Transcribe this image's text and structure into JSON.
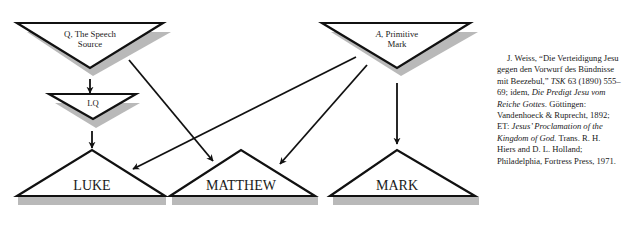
{
  "colors": {
    "stroke": "#111111",
    "shadow": "#b9b9b9",
    "text": "#1a1a1a",
    "background": "#ffffff"
  },
  "sources": {
    "q": {
      "line1": "Q, The Speech",
      "line2": "Source"
    },
    "lq": {
      "label": "LQ"
    },
    "a": {
      "siglum": "A",
      "line1_rest": ", Primitive",
      "line2": "Mark"
    }
  },
  "gospels": {
    "luke": {
      "label": "LUKE"
    },
    "matthew": {
      "label": "MATTHEW"
    },
    "mark": {
      "label": "MARK"
    }
  },
  "arrows": [
    {
      "from": "Q",
      "to": "LQ"
    },
    {
      "from": "LQ",
      "to": "LUKE"
    },
    {
      "from": "Q",
      "to": "MATTHEW"
    },
    {
      "from": "A",
      "to": "LUKE"
    },
    {
      "from": "A",
      "to": "MATTHEW"
    },
    {
      "from": "A",
      "to": "MARK"
    }
  ],
  "note": {
    "p1": "J. Weiss, “Die Verteidigung Jesu gegen den Vorwurf des Bündnisse mit Beezebul,” ",
    "p1_journal": "TSK",
    "p1_rest": " 63 (1890) 555–69; idem, ",
    "p2_title": "Die Predigt Jesu vom Reiche Gottes.",
    "p2_rest": " Göttingen: Vandenhoeck & Ruprecht, 1892; ET: ",
    "p3_title": "Jesus’ Proclamation of the Kingdom of God.",
    "p3_rest": " Trans. R. H. Hiers and D. L. Holland; Philadelphia, Fortress Press, 1971."
  }
}
